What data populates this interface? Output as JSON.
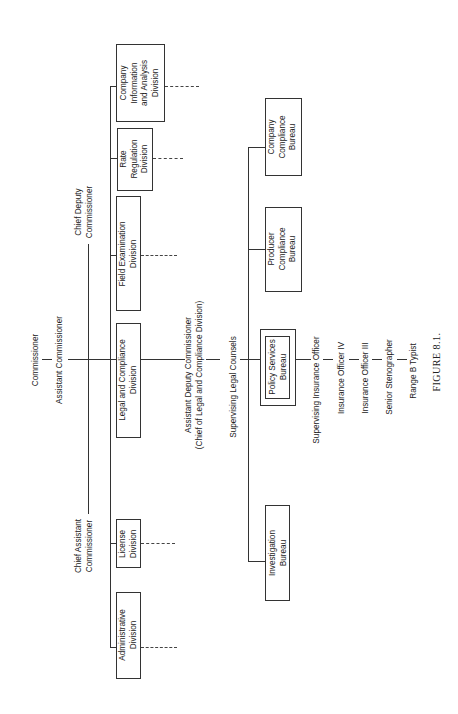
{
  "figure": {
    "caption": "FIGURE 8.1.",
    "top": {
      "commissioner": "Commissioner",
      "assistant_commissioner": "Assistant Commissioner",
      "chief_deputy_commissioner": [
        "Chief Deputy",
        "Commissioner"
      ],
      "chief_assistant_commissioner": [
        "Chief Assistant",
        "Commissioner"
      ]
    },
    "divisions": [
      {
        "name": [
          "Administrative",
          "Division"
        ]
      },
      {
        "name": [
          "License",
          "Division"
        ]
      },
      {
        "name": [
          "Legal and Compliance",
          "Division"
        ]
      },
      {
        "name": [
          "Field Examination",
          "Division"
        ]
      },
      {
        "name": [
          "Rate",
          "Regulation",
          "Division"
        ]
      },
      {
        "name": [
          "Company",
          "Information",
          "and Analysis",
          "Division"
        ]
      }
    ],
    "legal_chain": {
      "assistant_deputy_commissioner": [
        "Assistant Deputy Commissioner",
        "(Chief of Legal and Compliance Division)"
      ],
      "supervising_legal_counsels": "Supervising Legal Counsels"
    },
    "bureaus": [
      {
        "name": [
          "Investigation",
          "Bureau"
        ]
      },
      {
        "name": [
          "Policy Services",
          "Bureau"
        ],
        "highlighted": true
      },
      {
        "name": [
          "Producer",
          "Compliance",
          "Bureau"
        ]
      },
      {
        "name": [
          "Company",
          "Compliance",
          "Bureau"
        ]
      }
    ],
    "policy_services_staff": [
      "Supervising Insurance Officer",
      "Insurance Officer IV",
      "Insurance Officer III",
      "Senior Stenographer",
      "Range B Typist"
    ]
  }
}
